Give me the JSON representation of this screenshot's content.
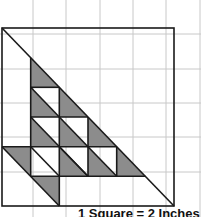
{
  "diagram": {
    "caption": "1 Square = 2 Inches",
    "colors": {
      "background": "#ffffff",
      "grid": "#c8c8c8",
      "outline": "#1a1a1a",
      "shade": "#8c8c8c"
    },
    "background_grid": {
      "x_lines": [
        0,
        33,
        66,
        100,
        133,
        166,
        200
      ],
      "y_lines": [
        0,
        34,
        69,
        103,
        137,
        172,
        206
      ]
    },
    "block": {
      "x": [
        2,
        30.7,
        59.3,
        88,
        116.7,
        145.3,
        174
      ],
      "y": [
        28,
        57.7,
        87.3,
        117,
        146.7,
        176.3,
        206
      ]
    }
  }
}
